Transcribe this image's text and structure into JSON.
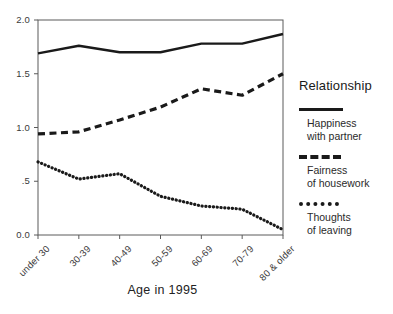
{
  "chart_data": {
    "type": "line",
    "title": "",
    "xlabel": "Age in 1995",
    "ylabel": "",
    "categories": [
      "under 30",
      "30-39",
      "40-49",
      "50-59",
      "60-69",
      "70-79",
      "80 & older"
    ],
    "ylim": [
      0.0,
      2.0
    ],
    "yticks": [
      "0.0",
      ".5",
      "1.0",
      "1.5",
      "2.0"
    ],
    "ytick_values": [
      0.0,
      0.5,
      1.0,
      1.5,
      2.0
    ],
    "grid": false,
    "legend_position": "right",
    "legend_title": "Relationship",
    "series": [
      {
        "name": "Happiness with partner",
        "style": "solid",
        "color": "#1a1a1a",
        "values": [
          1.69,
          1.76,
          1.7,
          1.7,
          1.78,
          1.78,
          1.87
        ]
      },
      {
        "name": "Fairness of housework",
        "style": "dashed",
        "color": "#1a1a1a",
        "values": [
          0.94,
          0.96,
          1.07,
          1.19,
          1.36,
          1.3,
          1.5
        ]
      },
      {
        "name": "Thoughts of leaving",
        "style": "dotted",
        "color": "#1a1a1a",
        "values": [
          0.68,
          0.52,
          0.57,
          0.36,
          0.27,
          0.24,
          0.05
        ]
      }
    ]
  },
  "legend": {
    "title": "Relationship",
    "entries": [
      {
        "line1": "Happiness",
        "line2": "with partner",
        "swatch": "solid-line-icon"
      },
      {
        "line1": "Fairness",
        "line2": "of housework",
        "swatch": "dashed-line-icon"
      },
      {
        "line1": "Thoughts",
        "line2": "of leaving",
        "swatch": "dotted-line-icon"
      }
    ]
  }
}
